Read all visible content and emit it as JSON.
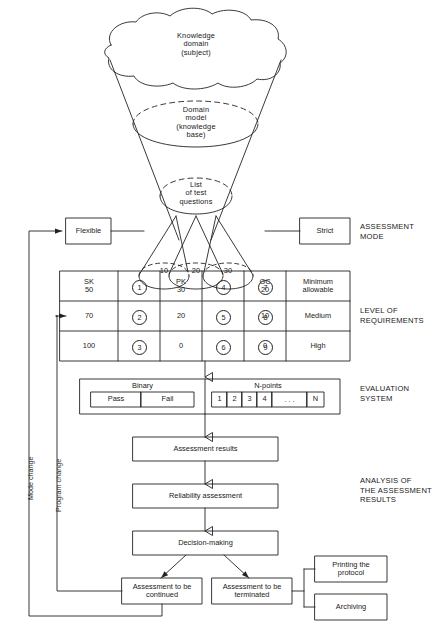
{
  "diagram": {
    "funnel": {
      "cloud_label": "Knowledge\ndomain\n(subject)",
      "cloud_lines": [
        "Knowledge",
        "domain",
        "(subject)"
      ],
      "domain_model_lines": [
        "Domain",
        "model",
        "(knowledge",
        "base)"
      ],
      "questions_lines": [
        "List",
        "of test",
        "questions"
      ],
      "cones": [
        {
          "label": "10"
        },
        {
          "label": "20"
        },
        {
          "label": "30"
        }
      ]
    },
    "mode": {
      "flexible": "Flexible",
      "strict": "Strict",
      "caption_lines": [
        "ASSESSMENT",
        "MODE"
      ]
    },
    "requirements": {
      "caption_lines": [
        "LEVEL OF",
        "REQUIREMENTS"
      ],
      "groups": [
        "SK",
        "PK",
        "GC"
      ],
      "rows": [
        {
          "level": "Minimum\nallowable",
          "level_lines": [
            "Minimum",
            "allowable"
          ],
          "values": [
            "50",
            "30",
            "20"
          ],
          "marks": [
            "1",
            "4",
            "7"
          ]
        },
        {
          "level": "Medium",
          "level_lines": [
            "Medium"
          ],
          "values": [
            "70",
            "20",
            "10"
          ],
          "marks": [
            "2",
            "5",
            "8"
          ]
        },
        {
          "level": "High",
          "level_lines": [
            "High"
          ],
          "values": [
            "100",
            "0",
            "0"
          ],
          "marks": [
            "3",
            "6",
            "9"
          ]
        }
      ]
    },
    "evaluation": {
      "caption_lines": [
        "EVALUATION",
        "SYSTEM"
      ],
      "binary": {
        "title": "Binary",
        "options": [
          "Pass",
          "Fail"
        ]
      },
      "npoints": {
        "title": "N-points",
        "cells": [
          "1",
          "2",
          "3",
          "4",
          ". . .",
          "N"
        ]
      }
    },
    "analysis": {
      "caption_lines": [
        "ANALYSIS OF",
        "THE ASSESSMENT",
        "RESULTS"
      ],
      "steps": [
        "Assessment results",
        "Reliability assessment",
        "Decision-making"
      ]
    },
    "outcomes": {
      "continued_lines": [
        "Assessment to be",
        "continued"
      ],
      "terminated_lines": [
        "Assessment to be",
        "terminated"
      ],
      "printing_lines": [
        "Printing the",
        "protocol"
      ],
      "archiving": "Archiving"
    },
    "feedback": {
      "mode_change": "Mode change",
      "program_change": "Program change"
    },
    "colors": {
      "ink": "#1a1a1a",
      "line": "#222222",
      "background": "#ffffff"
    }
  }
}
